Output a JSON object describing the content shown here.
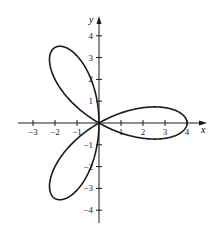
{
  "chart_data": {
    "type": "line",
    "title": "",
    "subtitle": "",
    "xlabel": "x",
    "ylabel": "y",
    "equation": "r = 4cos(3θ)",
    "xlim": [
      -3.5,
      4.7
    ],
    "ylim": [
      -4.5,
      4.5
    ],
    "x_ticks": [
      -3,
      -2,
      -1,
      1,
      2,
      3,
      4
    ],
    "x_tick_labels": [
      "−3",
      "−2",
      "−1",
      "1",
      "2",
      "3",
      "4"
    ],
    "y_ticks": [
      -4,
      -3,
      -2,
      -1,
      1,
      2,
      3,
      4
    ],
    "y_tick_labels": [
      "−4",
      "−3",
      "−2",
      "−1",
      "1",
      "2",
      "3",
      "4"
    ],
    "grid": false,
    "legend": null,
    "series": [
      {
        "name": "rose",
        "petals": 3,
        "amplitude": 4,
        "petal_angles_deg": [
          0,
          120,
          240
        ],
        "color": "#1a1a1a"
      }
    ]
  },
  "colors": {
    "axis": "#1a1a1a",
    "curve": "#1a1a1a",
    "background": "#ffffff"
  }
}
